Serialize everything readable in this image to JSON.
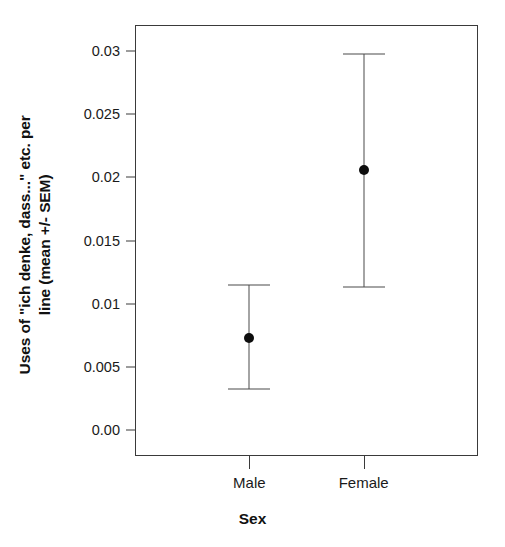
{
  "chart_data": {
    "type": "scatter",
    "title": "",
    "xlabel": "Sex",
    "ylabel": "Uses of \"ich denke, dass...\" etc. per line (mean +/- SEM)",
    "ylabel_lines": [
      "Uses of \"ich denke, dass...\" etc. per",
      "line (mean +/- SEM)"
    ],
    "categories": [
      "Male",
      "Female"
    ],
    "values": [
      0.0073,
      0.0206
    ],
    "error_low": [
      0.0032,
      0.0113
    ],
    "error_high": [
      0.0115,
      0.0298
    ],
    "ylim": [
      -0.0021,
      0.0321
    ],
    "ytick_labels": [
      "0.00",
      "0.005",
      "0.01",
      "0.015",
      "0.02",
      "0.025",
      "0.03"
    ],
    "ytick_values": [
      0.0,
      0.005,
      0.01,
      0.015,
      0.02,
      0.025,
      0.03
    ],
    "grid": false,
    "legend": "none",
    "marker": "filled-circle",
    "errorbar_style": "capped",
    "colors": {
      "background": "#ffffff",
      "axis": "#3a3a3a",
      "marker": "#0d0d0d",
      "errorbar": "#4a4a4a",
      "text": "#1a1a1a"
    }
  }
}
